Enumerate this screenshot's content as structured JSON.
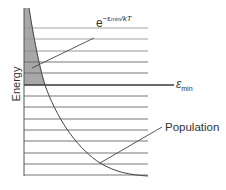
{
  "diagram": {
    "title": "",
    "y_axis_label": "Energy",
    "boltzmann_label": {
      "base": "e",
      "exponent_prefix": "−ε",
      "exponent_subscript": "min",
      "exponent_suffix": "/kT"
    },
    "emin_label": {
      "symbol": "ε",
      "subscript": "min"
    },
    "population_label": "Population",
    "energy_levels_count": 14,
    "energy_levels_y": [
      28,
      39,
      51,
      62,
      73,
      85,
      96,
      107,
      119,
      130,
      141,
      153,
      164,
      175
    ],
    "emin_level_index": 5,
    "colors": {
      "lines": "#555555",
      "emin_line": "#3a3a3a",
      "shade": "#a8a8a8",
      "curve": "#444444",
      "text": "#333333"
    }
  }
}
